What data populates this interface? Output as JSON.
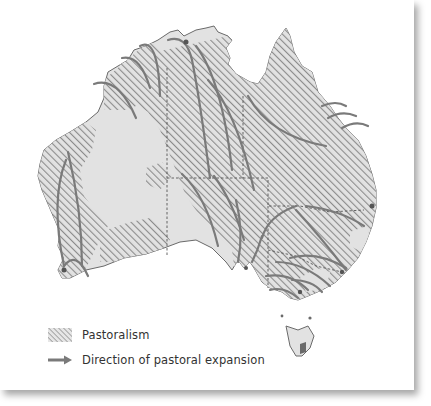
{
  "map": {
    "subject": "Australia",
    "colors": {
      "land": "#e2e2e2",
      "hatch": "#8c8c8c",
      "arrow": "#7a7a7a",
      "border": "#555555",
      "coast": "#6a6a6a",
      "background": "#ffffff"
    },
    "features": {
      "pastoral_regions": "hatched",
      "state_borders": "dashed",
      "expansion_arrows": "curved lines"
    }
  },
  "legend": {
    "items": [
      {
        "icon": "hatch-swatch-icon",
        "label": "Pastoralism"
      },
      {
        "icon": "arrow-right-icon",
        "label": "Direction of pastoral expansion"
      }
    ]
  }
}
